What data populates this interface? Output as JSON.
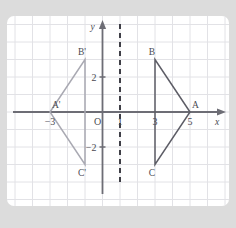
{
  "figure": {
    "background_color": "#dcdcdc",
    "card_color": "#ffffff",
    "grid_color": "#e2e2e6",
    "axis_color": "#6d6d75",
    "mirror_line_color": "#3e3e46",
    "watermark_text": ""
  },
  "axes": {
    "x_axis_label": "x",
    "y_axis_label": "y",
    "origin_label": "O",
    "x_ticks": [
      {
        "value": -3,
        "label": "−3"
      },
      {
        "value": 1,
        "label": "1"
      },
      {
        "value": 3,
        "label": "3"
      },
      {
        "value": 5,
        "label": "5"
      }
    ],
    "y_ticks": [
      {
        "value": 2,
        "label": "2"
      },
      {
        "value": -2,
        "label": "−2"
      }
    ]
  },
  "chart_data": {
    "type": "scatter",
    "title": "",
    "subtitle": "",
    "xlabel": "x",
    "ylabel": "y",
    "xlim": [
      -5,
      7
    ],
    "ylim": [
      -5,
      5
    ],
    "grid": true,
    "legend": "none",
    "annotations": [
      "Triangle ABC reflected across the vertical line x = 1 to give triangle A'B'C'"
    ],
    "mirror_line": {
      "type": "vertical",
      "x": 1,
      "style": "dashed",
      "color": "#3e3e46"
    },
    "series": [
      {
        "name": "Triangle ABC",
        "color": "#5d5d66",
        "closed": true,
        "points": [
          {
            "label": "A",
            "x": 5,
            "y": 0
          },
          {
            "label": "B",
            "x": 3,
            "y": 3
          },
          {
            "label": "C",
            "x": 3,
            "y": -3
          }
        ]
      },
      {
        "name": "Triangle A'B'C'",
        "color": "#a9a9b2",
        "closed": true,
        "points": [
          {
            "label": "A'",
            "x": -3,
            "y": 0
          },
          {
            "label": "B'",
            "x": -1,
            "y": 3
          },
          {
            "label": "C'",
            "x": -1,
            "y": -3
          }
        ]
      }
    ]
  }
}
